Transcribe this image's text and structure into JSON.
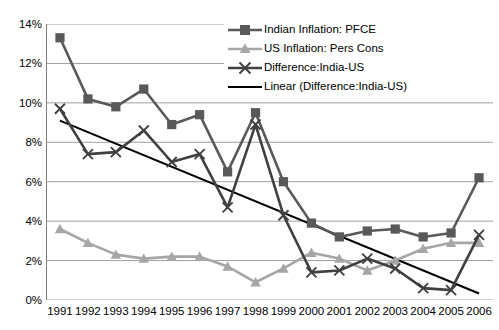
{
  "chart_data": {
    "type": "line",
    "title": "",
    "subtitle": "",
    "xlabel": "",
    "ylabel": "",
    "categories": [
      1991,
      1992,
      1993,
      1994,
      1995,
      1996,
      1997,
      1998,
      1999,
      2000,
      2001,
      2002,
      2003,
      2004,
      2005,
      2006
    ],
    "x_tick_labels": [
      "1991",
      "1992",
      "1993",
      "1994",
      "1995",
      "1996",
      "1997",
      "1998",
      "1999",
      "2000",
      "2001",
      "2002",
      "2003",
      "2004",
      "2005",
      "2006"
    ],
    "y_tick_labels": [
      "0%",
      "2%",
      "4%",
      "6%",
      "8%",
      "10%",
      "12%",
      "14%"
    ],
    "y_tick_values": [
      0,
      2,
      4,
      6,
      8,
      10,
      12,
      14
    ],
    "ylim": [
      0,
      14
    ],
    "grid": "horizontal",
    "legend_position": "top-right",
    "series": [
      {
        "name": "Indian Inflation: PFCE",
        "marker": "square",
        "color": "#595959",
        "values": [
          13.3,
          10.2,
          9.8,
          10.7,
          8.9,
          9.4,
          6.5,
          9.5,
          6.0,
          3.9,
          3.2,
          3.5,
          3.6,
          3.2,
          3.4,
          6.2
        ]
      },
      {
        "name": "US Inflation: Pers Cons",
        "marker": "triangle",
        "color": "#A6A6A6",
        "values": [
          3.6,
          2.9,
          2.3,
          2.1,
          2.2,
          2.2,
          1.7,
          0.9,
          1.6,
          2.4,
          2.1,
          1.5,
          2.0,
          2.6,
          2.9,
          2.9
        ]
      },
      {
        "name": "Difference:India-US",
        "marker": "cross",
        "color": "#404040",
        "values": [
          9.7,
          7.4,
          7.5,
          8.6,
          7.0,
          7.4,
          4.7,
          8.9,
          4.3,
          1.4,
          1.5,
          2.1,
          1.6,
          0.6,
          0.5,
          3.3
        ]
      },
      {
        "name": "Linear (Difference:India-US)",
        "marker": "none",
        "color": "#000000",
        "trendline": true,
        "values": [
          9.1,
          8.52,
          7.93,
          7.35,
          6.76,
          6.18,
          5.59,
          5.01,
          4.43,
          3.84,
          3.26,
          2.67,
          2.09,
          1.5,
          0.92,
          0.33
        ]
      }
    ]
  },
  "legend": {
    "items": [
      {
        "label": "Indian Inflation: PFCE",
        "key": "line-square-marker-icon"
      },
      {
        "label": "US Inflation: Pers Cons",
        "key": "line-triangle-marker-icon"
      },
      {
        "label": "Difference:India-US",
        "key": "line-cross-marker-icon"
      },
      {
        "label": "Linear (Difference:India-US)",
        "key": "plain-line-icon"
      }
    ]
  },
  "colors": {
    "indian": "#595959",
    "us": "#A6A6A6",
    "difference": "#404040",
    "trend": "#000000",
    "grid": "#A0A0A0",
    "axis": "#808080",
    "background": "#FFFFFF"
  }
}
